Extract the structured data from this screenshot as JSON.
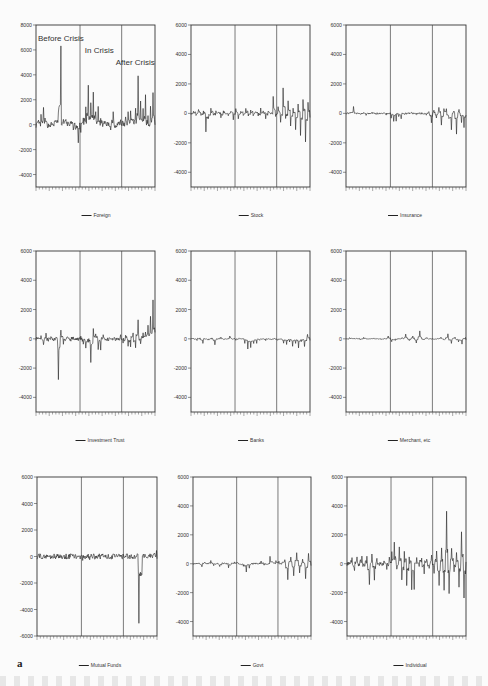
{
  "figure_label": "a",
  "chart_data": [
    {
      "type": "line",
      "title": "Foreign",
      "legend": "Foreign",
      "ylim": [
        -5000,
        8000
      ],
      "yticks": [
        8000,
        6000,
        4000,
        2000,
        0,
        -2000,
        -4000
      ],
      "periods": [
        "Before Crisis",
        "In Crisis",
        "After Crisis"
      ],
      "period_dividers_frac": [
        0.37,
        0.72
      ],
      "annotations": [
        "Before Crisis",
        "In Crisis",
        "After Crisis"
      ],
      "grid": false,
      "approx_extremes": {
        "max": 6100,
        "min": -1300
      },
      "series_profile": [
        0,
        200,
        600,
        1200,
        300,
        -100,
        0,
        100,
        500,
        800,
        6100,
        600,
        700,
        300,
        200,
        100,
        -200,
        -500,
        -1300,
        -400,
        300,
        1200,
        3200,
        1800,
        2900,
        2400,
        1200,
        1600,
        500,
        300,
        100,
        0,
        -200,
        1200,
        -100,
        100,
        300,
        400,
        100,
        600,
        900,
        1300,
        700,
        1100,
        3800,
        1900,
        1400,
        2400,
        800,
        -700,
        1600,
        2400,
        -400
      ]
    },
    {
      "type": "line",
      "title": "Stock",
      "legend": "Stock",
      "ylim": [
        -5000,
        6000
      ],
      "yticks": [
        6000,
        4000,
        2000,
        0,
        -2000,
        -4000
      ],
      "period_dividers_frac": [
        0.37,
        0.72
      ],
      "grid": false,
      "approx_extremes": {
        "max": 1700,
        "min": -1900
      },
      "series_profile": [
        0,
        200,
        -100,
        300,
        -200,
        100,
        -1200,
        -300,
        400,
        -200,
        200,
        100,
        -300,
        200,
        0,
        -100,
        200,
        -400,
        300,
        -300,
        200,
        -200,
        400,
        -200,
        300,
        -100,
        100,
        -200,
        300,
        100,
        -300,
        200,
        0,
        1200,
        -200,
        500,
        -600,
        1700,
        -400,
        800,
        -900,
        300,
        -1100,
        600,
        -1500,
        900,
        -1900,
        700,
        -1200
      ]
    },
    {
      "type": "line",
      "title": "Insurance",
      "legend": "Insurance",
      "ylim": [
        -5000,
        6000
      ],
      "yticks": [
        6000,
        4000,
        2000,
        0,
        -2000,
        -4000
      ],
      "period_dividers_frac": [
        0.37,
        0.72
      ],
      "grid": false,
      "approx_extremes": {
        "max": 450,
        "min": -1400
      },
      "series_profile": [
        0,
        100,
        450,
        0,
        50,
        -50,
        0,
        -100,
        0,
        50,
        -50,
        0,
        0,
        50,
        -100,
        0,
        -300,
        -500,
        -200,
        -400,
        0,
        -100,
        0,
        50,
        0,
        -50,
        0,
        0,
        -100,
        100,
        -600,
        200,
        -300,
        400,
        -800,
        300,
        -400,
        -1100,
        200,
        -1400,
        300,
        -600,
        -1000,
        -500
      ]
    },
    {
      "type": "line",
      "title": "Investment Trust",
      "legend": "Investment Trust",
      "ylim": [
        -5000,
        6000
      ],
      "yticks": [
        6000,
        4000,
        2000,
        0,
        -2000,
        -4000
      ],
      "period_dividers_frac": [
        0.37,
        0.72
      ],
      "grid": false,
      "approx_extremes": {
        "max": 2600,
        "min": -2700
      },
      "series_profile": [
        0,
        200,
        -300,
        300,
        -100,
        100,
        -200,
        200,
        -2700,
        700,
        -400,
        100,
        -100,
        200,
        0,
        -100,
        100,
        -300,
        -600,
        -300,
        -1600,
        600,
        300,
        -800,
        200,
        0,
        -100,
        100,
        0,
        -100,
        0,
        200,
        -200,
        300,
        -500,
        400,
        -600,
        1200,
        -300,
        400,
        500,
        900,
        1600,
        2600,
        1800
      ]
    },
    {
      "type": "line",
      "title": "Banks",
      "legend": "Banks",
      "ylim": [
        -5000,
        6000
      ],
      "yticks": [
        6000,
        4000,
        2000,
        0,
        -2000,
        -4000
      ],
      "period_dividers_frac": [
        0.37,
        0.72
      ],
      "grid": false,
      "approx_extremes": {
        "max": 350,
        "min": -700
      },
      "series_profile": [
        0,
        -100,
        50,
        -300,
        0,
        -100,
        50,
        -400,
        0,
        100,
        -50,
        0,
        200,
        0,
        -100,
        50,
        0,
        -300,
        -700,
        -600,
        -300,
        -100,
        0,
        -100,
        0,
        -50,
        0,
        -100,
        0,
        -300,
        -400,
        -200,
        -500,
        -300,
        -600,
        -200,
        -500,
        300,
        -400
      ]
    },
    {
      "type": "line",
      "title": "Merchant, etc",
      "legend": "Merchant, etc",
      "ylim": [
        -5000,
        6000
      ],
      "yticks": [
        6000,
        4000,
        2000,
        0,
        -2000,
        -4000
      ],
      "period_dividers_frac": [
        0.37,
        0.72
      ],
      "grid": false,
      "approx_extremes": {
        "max": 550,
        "min": -350
      },
      "series_profile": [
        0,
        100,
        0,
        50,
        -50,
        100,
        0,
        0,
        50,
        0,
        -50,
        0,
        200,
        -200,
        -100,
        0,
        100,
        300,
        -100,
        200,
        -300,
        550,
        -100,
        100,
        0,
        -50,
        0,
        100,
        -100,
        350,
        -300,
        100,
        -200,
        -350,
        100,
        -250
      ]
    },
    {
      "type": "line",
      "title": "Mutual Funds",
      "legend": "Mutual Funds",
      "ylim": [
        -6000,
        6000
      ],
      "yticks": [
        6000,
        4000,
        2000,
        0,
        -2000,
        -4000,
        -6000
      ],
      "period_dividers_frac": [
        0.37,
        0.72
      ],
      "grid": false,
      "approx_extremes": {
        "max": 300,
        "min": -5200
      },
      "series_profile": [
        0,
        0,
        50,
        0,
        0,
        -50,
        0,
        0,
        0,
        0,
        0,
        0,
        -200,
        100,
        -100,
        0,
        0,
        0,
        0,
        0,
        0,
        0,
        0,
        0,
        0,
        0,
        100,
        -5200,
        200,
        0,
        100,
        300,
        -200
      ]
    },
    {
      "type": "line",
      "title": "Govt",
      "legend": "Govt",
      "ylim": [
        -5000,
        6000
      ],
      "yticks": [
        6000,
        4000,
        2000,
        0,
        -2000,
        -4000
      ],
      "period_dividers_frac": [
        0.37,
        0.72
      ],
      "grid": false,
      "approx_extremes": {
        "max": 800,
        "min": -1100
      },
      "series_profile": [
        0,
        100,
        -200,
        100,
        0,
        200,
        -100,
        0,
        -200,
        100,
        0,
        -300,
        0,
        100,
        0,
        -200,
        -600,
        -300,
        0,
        100,
        0,
        200,
        -100,
        0,
        500,
        100,
        200,
        0,
        300,
        -1100,
        500,
        -800,
        800,
        -600,
        300,
        -1000,
        700,
        -400
      ]
    },
    {
      "type": "line",
      "title": "Individual",
      "legend": "Individual",
      "ylim": [
        -5000,
        6000
      ],
      "yticks": [
        6000,
        4000,
        2000,
        0,
        -2000,
        -4000
      ],
      "period_dividers_frac": [
        0.37,
        0.72
      ],
      "grid": false,
      "approx_extremes": {
        "max": 3600,
        "min": -2400
      },
      "series_profile": [
        0,
        400,
        -600,
        500,
        -200,
        600,
        -300,
        400,
        -1400,
        600,
        -1100,
        300,
        -200,
        0,
        200,
        -300,
        400,
        700,
        1500,
        -500,
        1300,
        -1200,
        900,
        -1600,
        600,
        -1900,
        400,
        -200,
        500,
        -700,
        300,
        -300,
        600,
        -600,
        800,
        -1600,
        1000,
        -1900,
        3600,
        -2000,
        1200,
        -600,
        900,
        -1700,
        2300,
        -2400,
        1000
      ]
    }
  ],
  "panels": [
    {
      "legend": "Foreign",
      "yticks": [
        "8000",
        "6000",
        "4000",
        "2000",
        "0",
        "-2000",
        "-4000"
      ],
      "annotations": {
        "before": "Before Crisis",
        "in": "In Crisis",
        "after": "After Crisis"
      }
    },
    {
      "legend": "Stock",
      "yticks": [
        "6000",
        "4000",
        "2000",
        "0",
        "-2000",
        "-4000"
      ]
    },
    {
      "legend": "Insurance",
      "yticks": [
        "6000",
        "4000",
        "2000",
        "0",
        "-2000",
        "-4000"
      ]
    },
    {
      "legend": "Investment Trust",
      "yticks": [
        "6000",
        "4000",
        "2000",
        "0",
        "-2000",
        "-4000"
      ]
    },
    {
      "legend": "Banks",
      "yticks": [
        "6000",
        "4000",
        "2000",
        "0",
        "-2000",
        "-4000"
      ]
    },
    {
      "legend": "Merchant, etc",
      "yticks": [
        "6000",
        "4000",
        "2000",
        "0",
        "-2000",
        "-4000"
      ]
    },
    {
      "legend": "Mutual Funds",
      "yticks": [
        "6000",
        "4000",
        "2000",
        "0",
        "-2000",
        "-4000",
        "-6000"
      ]
    },
    {
      "legend": "Govt",
      "yticks": [
        "6000",
        "4000",
        "2000",
        "0",
        "-2000",
        "-4000"
      ]
    },
    {
      "legend": "Individual",
      "yticks": [
        "6000",
        "4000",
        "2000",
        "0",
        "-2000",
        "-4000"
      ]
    }
  ],
  "colors": {
    "line": "#222222",
    "axis": "#333333",
    "background": "#fbfbfb"
  }
}
